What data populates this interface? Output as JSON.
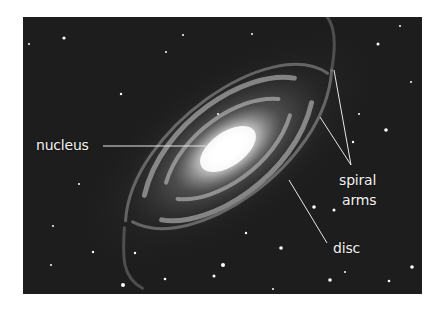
{
  "diagram": {
    "background_color": "#1d1d1d",
    "labels": [
      {
        "id": "nucleus",
        "text": "nucleus"
      },
      {
        "id": "spiral-arms",
        "lines": [
          "spiral",
          "arms"
        ]
      },
      {
        "id": "disc",
        "text": "disc"
      }
    ]
  }
}
